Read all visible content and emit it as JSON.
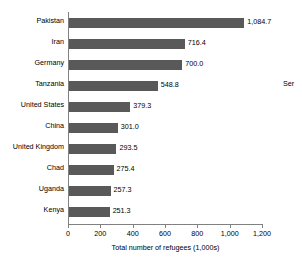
{
  "chart_data": {
    "type": "bar",
    "orientation": "horizontal",
    "title": "",
    "xlabel": "Total number of refugees (1,000s)",
    "ylabel": "",
    "xlim": [
      0,
      1200
    ],
    "xticks": [
      "0",
      "200",
      "400",
      "600",
      "800",
      "1,000",
      "1,200"
    ],
    "xtick_values": [
      0,
      200,
      400,
      600,
      800,
      1000,
      1200
    ],
    "grid": false,
    "legend_position": "right",
    "legend_entries": [
      "Ser"
    ],
    "bar_color": "#595959",
    "axis_color": "#808080",
    "categories": [
      "Pakistan",
      "Iran",
      "Germany",
      "Tanzania",
      "United States",
      "China",
      "United Kingdom",
      "Chad",
      "Uganda",
      "Kenya"
    ],
    "values": [
      1084.7,
      716.4,
      700.0,
      548.8,
      379.3,
      301.0,
      293.5,
      275.4,
      257.3,
      251.3
    ],
    "value_labels": [
      "1,084.7",
      "716.4",
      "700.0",
      "548.8",
      "379.3",
      "301.0",
      "293.5",
      "275.4",
      "257.3",
      "251.3"
    ]
  }
}
